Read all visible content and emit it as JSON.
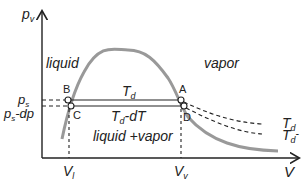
{
  "diagram": {
    "axes": {
      "y_label": "p",
      "y_label_sub": "v",
      "x_label": "V"
    },
    "regions": {
      "liquid": "liquid",
      "vapor": "vapor",
      "mixed": "liquid +vapor"
    },
    "points": {
      "A": "A",
      "B": "B",
      "C": "C",
      "D": "D"
    },
    "isotherms": {
      "upper": {
        "main": "T",
        "sub": "d",
        "suffix": ""
      },
      "lower": {
        "main": "T",
        "sub": "d",
        "suffix": "-dT"
      }
    },
    "right_labels": {
      "upper": {
        "main": "T",
        "sub": "d",
        "suffix": ""
      },
      "lower": {
        "main": "T",
        "sub": "d",
        "suffix": "-"
      }
    },
    "y_ticks": {
      "ps": {
        "main": "p",
        "sub": "s",
        "suffix": ""
      },
      "ps_dp": {
        "main": "p",
        "sub": "s",
        "suffix": "-dp"
      }
    },
    "x_ticks": {
      "vl": {
        "main": "V",
        "sub": "l"
      },
      "vv": {
        "main": "V",
        "sub": "v"
      }
    },
    "colors": {
      "curve": "#999999",
      "lines": "#222222"
    }
  }
}
